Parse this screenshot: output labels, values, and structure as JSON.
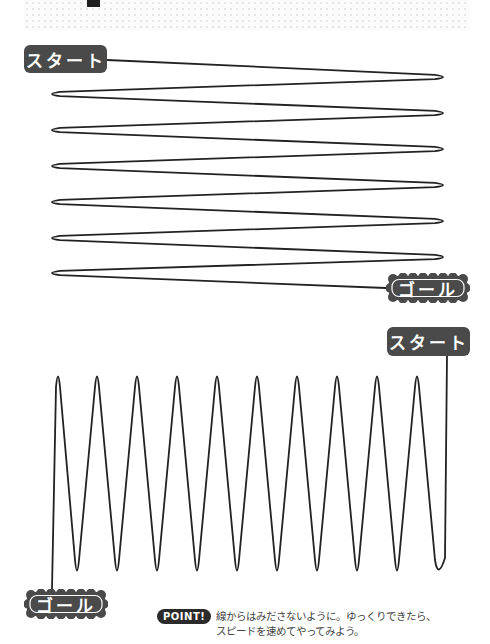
{
  "header": {
    "decor": "dotted-band"
  },
  "exercise_1": {
    "start_label": "スタート",
    "goal_label": "ゴール",
    "direction": "horizontal-zigzag",
    "right_turns_y": [
      77,
      113,
      149,
      185,
      221,
      257
    ],
    "left_turns_y": [
      94,
      130,
      166,
      202,
      238,
      273
    ]
  },
  "exercise_2": {
    "start_label": "スタート",
    "goal_label": "ゴール",
    "direction": "vertical-wave",
    "peaks_x": [
      58,
      97,
      137,
      177,
      217,
      257,
      297,
      337,
      377,
      417
    ],
    "troughs_x": [
      77,
      117,
      157,
      197,
      237,
      277,
      317,
      357,
      397,
      437
    ]
  },
  "point": {
    "badge_label": "POINT!",
    "line1": "線からはみださないように。ゆっくりできたら、",
    "line2": "スピードを速めてやってみよう。"
  },
  "colors": {
    "badge_dark": "#4a4a4a",
    "line": "#222222",
    "point_badge": "#2b2b2b"
  }
}
